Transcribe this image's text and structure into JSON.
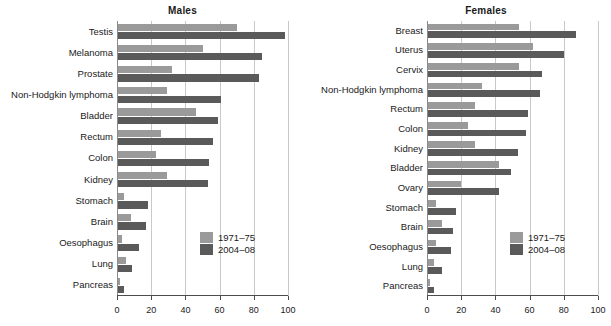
{
  "chart_data": [
    {
      "type": "bar",
      "orientation": "horizontal",
      "title": "Males",
      "xlabel": "",
      "ylabel": "",
      "xlim": [
        0,
        100
      ],
      "xticks": [
        0,
        20,
        40,
        60,
        80,
        100
      ],
      "grid": true,
      "legend_position": "bottom-right",
      "categories": [
        "Testis",
        "Melanoma",
        "Prostate",
        "Non-Hodgkin lymphoma",
        "Bladder",
        "Rectum",
        "Colon",
        "Kidney",
        "Stomach",
        "Brain",
        "Oesophagus",
        "Lung",
        "Pancreas"
      ],
      "series": [
        {
          "name": "1971–75",
          "color": "#9a9a9a",
          "values": [
            70,
            50,
            32,
            29,
            46,
            26,
            23,
            29,
            4,
            8,
            3,
            5,
            2
          ]
        },
        {
          "name": "2004–08",
          "color": "#5a5a5a",
          "values": [
            98,
            85,
            83,
            61,
            59,
            56,
            54,
            53,
            18,
            17,
            13,
            9,
            4
          ]
        }
      ]
    },
    {
      "type": "bar",
      "orientation": "horizontal",
      "title": "Females",
      "xlabel": "",
      "ylabel": "",
      "xlim": [
        0,
        100
      ],
      "xticks": [
        0,
        20,
        40,
        60,
        80,
        100
      ],
      "grid": true,
      "legend_position": "bottom-right",
      "categories": [
        "Breast",
        "Uterus",
        "Cervix",
        "Non-Hodgkin lymphoma",
        "Rectum",
        "Colon",
        "Kidney",
        "Bladder",
        "Ovary",
        "Stomach",
        "Brain",
        "Oesophagus",
        "Lung",
        "Pancreas"
      ],
      "series": [
        {
          "name": "1971–75",
          "color": "#9a9a9a",
          "values": [
            54,
            62,
            54,
            32,
            28,
            24,
            28,
            42,
            20,
            5,
            9,
            5,
            4,
            2
          ]
        },
        {
          "name": "2004–08",
          "color": "#5a5a5a",
          "values": [
            87,
            80,
            67,
            66,
            59,
            58,
            53,
            49,
            42,
            17,
            15,
            14,
            9,
            4
          ]
        }
      ]
    }
  ],
  "panels": {
    "males": {
      "title": "Males",
      "legend": [
        {
          "label": "1971–75",
          "color": "#9a9a9a"
        },
        {
          "label": "2004–08",
          "color": "#5a5a5a"
        }
      ]
    },
    "females": {
      "title": "Females",
      "legend": [
        {
          "label": "1971–75",
          "color": "#9a9a9a"
        },
        {
          "label": "2004–08",
          "color": "#5a5a5a"
        }
      ]
    }
  }
}
